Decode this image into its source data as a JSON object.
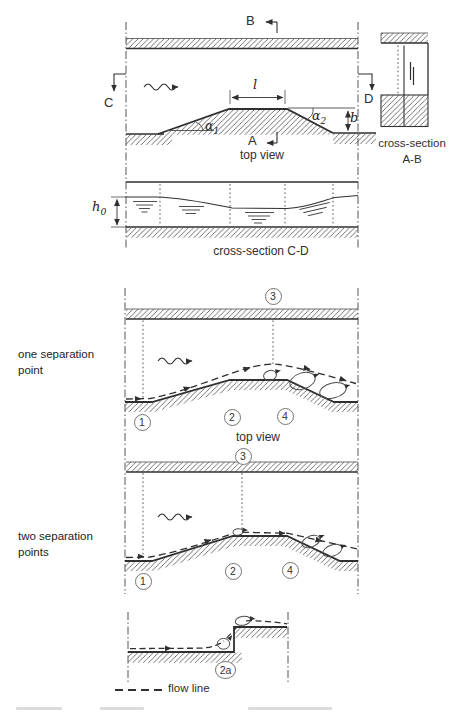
{
  "palette": {
    "ink": "#2f2f2f",
    "paper": "#ffffff",
    "construction": "#4a4a4a"
  },
  "top_view": {
    "section_b": "B",
    "section_c": "C",
    "section_d": "D",
    "section_a": "A",
    "dim_length": "l",
    "dim_width": "b",
    "angle_base": "α",
    "angle1_sub": "1",
    "angle2_sub": "2",
    "caption": "top view"
  },
  "cross_section_ab": {
    "line1": "cross-section",
    "line2": "A-B"
  },
  "cross_section_cd": {
    "depth_base": "h",
    "depth_sub": "0",
    "caption": "cross-section C-D"
  },
  "one_separation": {
    "label_line1": "one separation",
    "label_line2": "point",
    "caption": "top view",
    "point1": "1",
    "point2": "2",
    "point3": "3",
    "point4": "4"
  },
  "two_separation": {
    "label_line1": "two separation",
    "label_line2": "points",
    "point1": "1",
    "point2": "2",
    "point3": "3",
    "point4": "4"
  },
  "step_detail": {
    "point_2a": "2a"
  },
  "legend": {
    "flow_line": "flow line"
  }
}
